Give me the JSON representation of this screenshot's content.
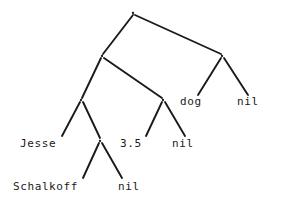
{
  "diagram": {
    "type": "tree",
    "background_color": "#ffffff",
    "stroke_color": "#1a1a1a",
    "text_color": "#1a1a1a",
    "node_glyph": ".",
    "nodes": [
      {
        "id": "n1",
        "label": ".",
        "x": 133,
        "y": 13,
        "level": 0
      },
      {
        "id": "n2",
        "label": ".",
        "x": 102,
        "y": 56,
        "level": 1
      },
      {
        "id": "n3",
        "label": ".",
        "x": 222,
        "y": 56,
        "level": 1
      },
      {
        "id": "n4",
        "label": ".",
        "x": 81,
        "y": 100,
        "level": 2
      },
      {
        "id": "n5",
        "label": ".",
        "x": 163,
        "y": 100,
        "level": 2
      },
      {
        "id": "n6",
        "label": ".",
        "x": 100,
        "y": 141,
        "level": 3
      }
    ],
    "edges": [
      {
        "from": "n1",
        "to": "n2",
        "x1": 133,
        "y1": 15,
        "x2": 103,
        "y2": 54
      },
      {
        "from": "n1",
        "to": "n3",
        "x1": 135,
        "y1": 15,
        "x2": 221,
        "y2": 54
      },
      {
        "from": "n2",
        "to": "n4",
        "x1": 101,
        "y1": 58,
        "x2": 82,
        "y2": 98
      },
      {
        "from": "n2",
        "to": "n5",
        "x1": 104,
        "y1": 58,
        "x2": 162,
        "y2": 98
      },
      {
        "from": "n3",
        "to": "dog",
        "x1": 221,
        "y1": 58,
        "x2": 198,
        "y2": 95
      },
      {
        "from": "n3",
        "to": "nil_r",
        "x1": 224,
        "y1": 58,
        "x2": 248,
        "y2": 95
      },
      {
        "from": "n4",
        "to": "jesse",
        "x1": 80,
        "y1": 102,
        "x2": 62,
        "y2": 136
      },
      {
        "from": "n4",
        "to": "n6",
        "x1": 83,
        "y1": 102,
        "x2": 100,
        "y2": 138
      },
      {
        "from": "n5",
        "to": "three_five",
        "x1": 162,
        "y1": 102,
        "x2": 146,
        "y2": 136
      },
      {
        "from": "n5",
        "to": "nil_m",
        "x1": 165,
        "y1": 102,
        "x2": 185,
        "y2": 136
      },
      {
        "from": "n6",
        "to": "schalkoff",
        "x1": 99,
        "y1": 143,
        "x2": 83,
        "y2": 178
      },
      {
        "from": "n6",
        "to": "nil_b",
        "x1": 102,
        "y1": 143,
        "x2": 122,
        "y2": 178
      }
    ],
    "leaves": [
      {
        "id": "dog",
        "text": "dog",
        "x": 180,
        "y": 96
      },
      {
        "id": "nil_r",
        "text": "nil",
        "x": 237,
        "y": 96
      },
      {
        "id": "jesse",
        "text": "Jesse",
        "x": 20,
        "y": 138
      },
      {
        "id": "three_five",
        "text": "3.5",
        "x": 120,
        "y": 138
      },
      {
        "id": "nil_m",
        "text": "nil",
        "x": 172,
        "y": 138
      },
      {
        "id": "schalkoff",
        "text": "Schalkoff",
        "x": 13,
        "y": 181
      },
      {
        "id": "nil_b",
        "text": "nil",
        "x": 118,
        "y": 181
      }
    ]
  }
}
